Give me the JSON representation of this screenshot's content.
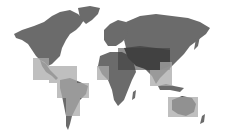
{
  "map": {
    "title": "World map with highlighted regions",
    "background_color": "#ffffff",
    "land_color": "#6b6b6b",
    "land_dark_color": "#4a4a4a",
    "highlight_color": "#a9a9a9",
    "highlight_dark_color": "#3a3a3a",
    "highlighted_regions": [
      {
        "name": "Mexico / Central America",
        "x": 33,
        "y": 58,
        "w": 16,
        "h": 22
      },
      {
        "name": "Caribbean",
        "x": 49,
        "y": 66,
        "w": 28,
        "h": 17
      },
      {
        "name": "Northern South America",
        "x": 57,
        "y": 83,
        "w": 32,
        "h": 15
      },
      {
        "name": "Southern South America",
        "x": 66,
        "y": 98,
        "w": 14,
        "h": 18
      },
      {
        "name": "West Africa",
        "x": 97,
        "y": 66,
        "w": 12,
        "h": 14
      },
      {
        "name": "Middle East / Central Asia",
        "x": 118,
        "y": 48,
        "w": 52,
        "h": 22
      },
      {
        "name": "South Asia",
        "x": 150,
        "y": 70,
        "w": 10,
        "h": 16
      },
      {
        "name": "Southeast Asia",
        "x": 160,
        "y": 62,
        "w": 12,
        "h": 24
      },
      {
        "name": "Australia",
        "x": 168,
        "y": 97,
        "w": 30,
        "h": 20
      }
    ]
  }
}
